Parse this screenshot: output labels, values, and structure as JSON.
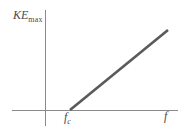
{
  "figure": {
    "background_color": "#ffffff",
    "axis_color": "#8a8a8a",
    "line_color": "#5a5a5a",
    "text_color": "#4a4a4a",
    "y_axis_label": {
      "base": "KE",
      "subscript": "max"
    },
    "x_axis_label": {
      "base": "f",
      "subscript": ""
    },
    "threshold_label": {
      "base": "f",
      "subscript": "c"
    }
  },
  "chart_data": {
    "type": "line",
    "title": "",
    "xlabel": "f",
    "ylabel": "KE_max",
    "grid": false,
    "legend": null,
    "annotations": [
      {
        "text": "f_c",
        "x": 70,
        "y": 0,
        "note": "threshold frequency at x-intercept"
      }
    ],
    "axes": {
      "x_axis": {
        "start_px": 12,
        "end_px": 178,
        "y_px": 110,
        "arrow": false
      },
      "y_axis": {
        "x_px": 45,
        "top_px": 10,
        "bottom_px": 126,
        "arrow": false
      }
    },
    "series": [
      {
        "name": "KE_max vs f",
        "x": [
          70,
          168
        ],
        "y": [
          0,
          80
        ],
        "x_px": [
          70,
          168
        ],
        "y_px": [
          110,
          30
        ],
        "style": "solid",
        "width_px": 2.6
      }
    ],
    "xlim": [
      0,
      183
    ],
    "ylim": [
      0,
      110
    ]
  }
}
